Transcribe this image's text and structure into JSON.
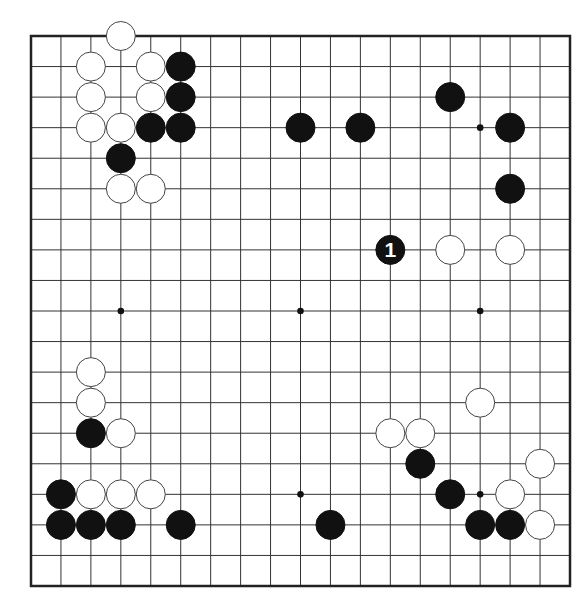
{
  "diagram": {
    "type": "go-board",
    "size": 19,
    "colors": {
      "black": "#111111",
      "white": "#ffffff",
      "line": "#333333",
      "frame": "#222222"
    },
    "star_points": [
      [
        3,
        3
      ],
      [
        9,
        3
      ],
      [
        15,
        3
      ],
      [
        3,
        9
      ],
      [
        9,
        9
      ],
      [
        15,
        9
      ],
      [
        3,
        15
      ],
      [
        9,
        15
      ],
      [
        15,
        15
      ]
    ],
    "stones": [
      {
        "col": 3,
        "row": 0,
        "color": "white"
      },
      {
        "col": 2,
        "row": 1,
        "color": "white"
      },
      {
        "col": 4,
        "row": 1,
        "color": "white"
      },
      {
        "col": 5,
        "row": 1,
        "color": "black"
      },
      {
        "col": 2,
        "row": 2,
        "color": "white"
      },
      {
        "col": 4,
        "row": 2,
        "color": "white"
      },
      {
        "col": 5,
        "row": 2,
        "color": "black"
      },
      {
        "col": 2,
        "row": 3,
        "color": "white"
      },
      {
        "col": 3,
        "row": 3,
        "color": "white"
      },
      {
        "col": 4,
        "row": 3,
        "color": "black"
      },
      {
        "col": 5,
        "row": 3,
        "color": "black"
      },
      {
        "col": 3,
        "row": 4,
        "color": "black"
      },
      {
        "col": 3,
        "row": 5,
        "color": "white"
      },
      {
        "col": 4,
        "row": 5,
        "color": "white"
      },
      {
        "col": 9,
        "row": 3,
        "color": "black"
      },
      {
        "col": 11,
        "row": 3,
        "color": "black"
      },
      {
        "col": 14,
        "row": 2,
        "color": "black"
      },
      {
        "col": 16,
        "row": 3,
        "color": "black"
      },
      {
        "col": 16,
        "row": 5,
        "color": "black"
      },
      {
        "col": 12,
        "row": 7,
        "color": "black",
        "label": "1"
      },
      {
        "col": 14,
        "row": 7,
        "color": "white"
      },
      {
        "col": 16,
        "row": 7,
        "color": "white"
      },
      {
        "col": 2,
        "row": 11,
        "color": "white"
      },
      {
        "col": 2,
        "row": 12,
        "color": "white"
      },
      {
        "col": 2,
        "row": 13,
        "color": "black"
      },
      {
        "col": 3,
        "row": 13,
        "color": "white"
      },
      {
        "col": 1,
        "row": 15,
        "color": "black"
      },
      {
        "col": 2,
        "row": 15,
        "color": "white"
      },
      {
        "col": 3,
        "row": 15,
        "color": "white"
      },
      {
        "col": 4,
        "row": 15,
        "color": "white"
      },
      {
        "col": 1,
        "row": 16,
        "color": "black"
      },
      {
        "col": 2,
        "row": 16,
        "color": "black"
      },
      {
        "col": 3,
        "row": 16,
        "color": "black"
      },
      {
        "col": 5,
        "row": 16,
        "color": "black"
      },
      {
        "col": 10,
        "row": 16,
        "color": "black"
      },
      {
        "col": 12,
        "row": 13,
        "color": "white"
      },
      {
        "col": 13,
        "row": 13,
        "color": "white"
      },
      {
        "col": 13,
        "row": 14,
        "color": "black"
      },
      {
        "col": 14,
        "row": 15,
        "color": "black"
      },
      {
        "col": 15,
        "row": 12,
        "color": "white"
      },
      {
        "col": 17,
        "row": 14,
        "color": "white"
      },
      {
        "col": 16,
        "row": 15,
        "color": "white"
      },
      {
        "col": 15,
        "row": 16,
        "color": "black"
      },
      {
        "col": 16,
        "row": 16,
        "color": "black"
      },
      {
        "col": 17,
        "row": 16,
        "color": "white"
      }
    ],
    "move_labels": [
      {
        "label": "1",
        "col": 12,
        "row": 7
      }
    ]
  }
}
